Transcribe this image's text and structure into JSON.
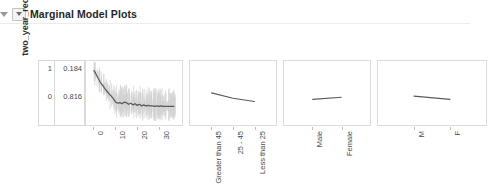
{
  "header": {
    "title": "Marginal Model Plots",
    "collapse_icon": "triangle-down-icon",
    "toggle_icon": "triangle-down-boxed-icon"
  },
  "chart_data": {
    "type": "line",
    "title": "Marginal Model Plots",
    "ylabel": "two_year_recid",
    "y_class_labels": [
      "1",
      "0"
    ],
    "y_proportion_labels": [
      "0.184",
      "0.816"
    ],
    "ylim": [
      0,
      1
    ],
    "grid": false,
    "legend": "none",
    "panels": [
      {
        "name": "priors_count",
        "xlabel": "priors_count",
        "type": "numeric",
        "tick_labels": [
          "0",
          "10",
          "20",
          "30"
        ],
        "tick_values": [
          0,
          10,
          20,
          30
        ],
        "xlim": [
          -1,
          38
        ],
        "has_uncertainty_band": true,
        "series": [
          {
            "name": "fitted",
            "x": [
              0,
              1,
              2,
              3,
              4,
              5,
              6,
              7,
              8,
              9,
              10,
              11,
              12,
              13,
              14,
              15,
              16,
              17,
              18,
              19,
              20,
              21,
              22,
              23,
              24,
              25,
              26,
              27,
              28,
              29,
              30,
              31,
              32,
              33,
              34,
              35,
              36,
              37
            ],
            "values": [
              0.93,
              0.86,
              0.78,
              0.71,
              0.66,
              0.6,
              0.55,
              0.5,
              0.46,
              0.41,
              0.35,
              0.33,
              0.34,
              0.32,
              0.35,
              0.34,
              0.31,
              0.33,
              0.3,
              0.32,
              0.29,
              0.31,
              0.28,
              0.3,
              0.28,
              0.29,
              0.28,
              0.28,
              0.27,
              0.28,
              0.27,
              0.28,
              0.27,
              0.27,
              0.27,
              0.27,
              0.27,
              0.27
            ]
          }
        ]
      },
      {
        "name": "age_cat",
        "xlabel": "age_cat",
        "type": "categorical",
        "tick_labels": [
          "Greater than 45",
          "25 - 45",
          "Less than 25"
        ],
        "series": [
          {
            "name": "fitted",
            "values": [
              0.52,
              0.42,
              0.36
            ]
          }
        ]
      },
      {
        "name": "sex",
        "xlabel": "sex",
        "type": "categorical",
        "tick_labels": [
          "Male",
          "Female"
        ],
        "series": [
          {
            "name": "fitted",
            "values": [
              0.4,
              0.44
            ]
          }
        ]
      },
      {
        "name": "c_charge_degree",
        "xlabel": "c_charge_degree",
        "type": "categorical",
        "tick_labels": [
          "M",
          "F"
        ],
        "series": [
          {
            "name": "fitted",
            "values": [
              0.46,
              0.4
            ]
          }
        ]
      }
    ]
  },
  "colors": {
    "line": "#5a5a5a",
    "band": "#c9c9c9",
    "panel_border": "#dcdcdc",
    "text": "#3b3b3b"
  }
}
